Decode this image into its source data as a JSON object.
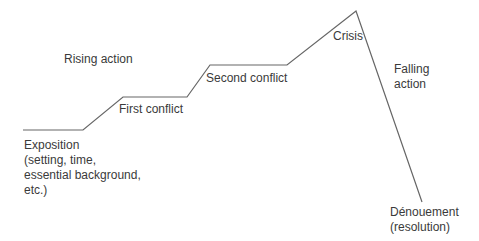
{
  "diagram": {
    "type": "plot-structure (Freytag-style)",
    "line_color": "#666666",
    "path_points": [
      [
        23,
        130
      ],
      [
        83,
        130
      ],
      [
        123,
        97
      ],
      [
        187,
        97
      ],
      [
        210,
        65
      ],
      [
        287,
        65
      ],
      [
        356,
        11
      ],
      [
        422,
        202
      ]
    ],
    "labels": {
      "rising_action": "Rising action",
      "first_conflict": "First conflict",
      "second_conflict": "Second conflict",
      "crisis": "Crisis",
      "falling_action_1": "Falling",
      "falling_action_2": "action",
      "exposition_1": "Exposition",
      "exposition_2": "(setting, time,",
      "exposition_3": "essential background,",
      "exposition_4": "etc.)",
      "denouement_1": "Dénouement",
      "denouement_2": "(resolution)"
    }
  }
}
